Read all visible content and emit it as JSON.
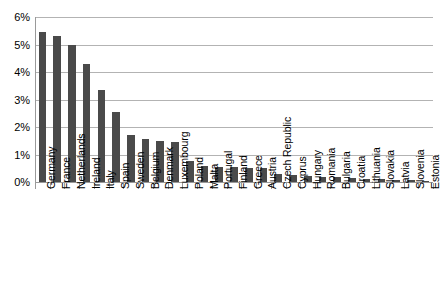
{
  "chart_data": {
    "type": "bar",
    "title": "",
    "subtitle": "",
    "xlabel": "",
    "ylabel": "",
    "ylim": [
      0,
      6
    ],
    "ytick_labels": [
      "0%",
      "1%",
      "2%",
      "3%",
      "4%",
      "5%",
      "6%"
    ],
    "ytick_values": [
      0,
      1,
      2,
      3,
      4,
      5,
      6
    ],
    "grid": true,
    "legend": null,
    "bar_color": "#4a4a4a",
    "gridline_color": "#b3b3b3",
    "axis_color": "#9a9a9a",
    "categories": [
      "Germany",
      "France",
      "Netherlands",
      "Ireland",
      "Italy",
      "Spain",
      "Sweden",
      "Belgium",
      "Denmark",
      "Luxembourg",
      "Poland",
      "Malta",
      "Portugal",
      "Finland",
      "Greece",
      "Austria",
      "Czech Republic",
      "Cyprus",
      "Hungary",
      "Romania",
      "Bulgaria",
      "Croatia",
      "Lithuania",
      "Slovakia",
      "Latvia",
      "Slovenia",
      "Estonia"
    ],
    "values": [
      5.45,
      5.3,
      5.0,
      4.3,
      3.35,
      2.55,
      1.7,
      1.55,
      1.5,
      1.45,
      0.75,
      0.6,
      0.55,
      0.55,
      0.5,
      0.5,
      0.3,
      0.25,
      0.23,
      0.2,
      0.2,
      0.15,
      0.1,
      0.1,
      0.08,
      0.07,
      0.03
    ]
  }
}
